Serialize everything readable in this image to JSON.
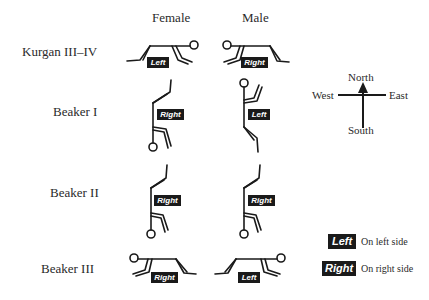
{
  "columns": {
    "female": "Female",
    "male": "Male"
  },
  "rows": [
    {
      "label": "Kurgan III–IV",
      "female_side": "Left",
      "male_side": "Right"
    },
    {
      "label": "Beaker I",
      "female_side": "Right",
      "male_side": "Left"
    },
    {
      "label": "Beaker II",
      "female_side": "Right",
      "male_side": "Right"
    },
    {
      "label": "Beaker III",
      "female_side": "Right",
      "male_side": "Left"
    }
  ],
  "compass": {
    "north": "North",
    "south": "South",
    "west": "West",
    "east": "East"
  },
  "legend": [
    {
      "tag": "Left",
      "text": "On left side"
    },
    {
      "tag": "Right",
      "text": "On right side"
    }
  ],
  "colors": {
    "ink": "#1a1a1a",
    "background": "#ffffff"
  }
}
